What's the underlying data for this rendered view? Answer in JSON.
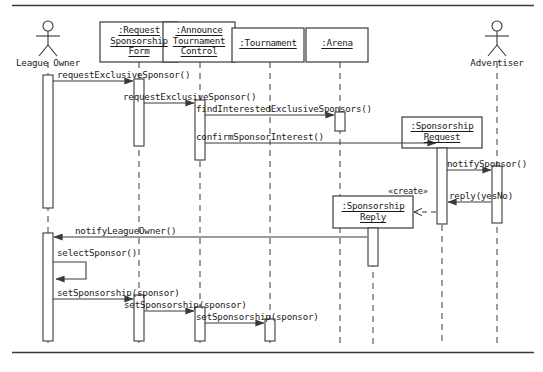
{
  "diagram": {
    "kind": "uml-sequence-diagram",
    "title": "",
    "frame": {
      "top_rule_y": 5,
      "bottom_rule_y": 352,
      "rule_color": "#3a3a3a"
    },
    "stroke_color": "#3a3a3a",
    "text_color": "#1a1a1a",
    "actors": [
      {
        "id": "league-owner",
        "label": "League Owner",
        "type": "actor",
        "x": 48
      },
      {
        "id": "advertiser",
        "label": "Advertiser",
        "type": "actor",
        "x": 497
      }
    ],
    "objects": [
      {
        "id": "request-sponsorship-form",
        "lines": [
          ":Request",
          "Sponsorship",
          "Form"
        ],
        "x": 139,
        "box": {
          "left": 100,
          "top": 22,
          "width": 78,
          "height": 40
        }
      },
      {
        "id": "announce-tournament-control",
        "lines": [
          ":Announce",
          "Tournament",
          "Control"
        ],
        "x": 200,
        "box": {
          "left": 163,
          "top": 22,
          "width": 72,
          "height": 40
        }
      },
      {
        "id": "tournament",
        "lines": [
          ":Tournament"
        ],
        "x": 270,
        "box": {
          "left": 232,
          "top": 28,
          "width": 72,
          "height": 34
        }
      },
      {
        "id": "arena",
        "lines": [
          ":Arena"
        ],
        "x": 340,
        "box": {
          "left": 306,
          "top": 28,
          "width": 62,
          "height": 34
        }
      },
      {
        "id": "sponsorship-request",
        "lines": [
          ":Sponsorship",
          "Request"
        ],
        "x": 442,
        "box": {
          "left": 402,
          "top": 117,
          "width": 80,
          "height": 31
        },
        "created": true
      },
      {
        "id": "sponsorship-reply",
        "lines": [
          ":Sponsorship",
          "Reply"
        ],
        "x": 373,
        "box": {
          "left": 333,
          "top": 196,
          "width": 80,
          "height": 32
        },
        "created": true
      }
    ],
    "messages": [
      {
        "id": "m1",
        "label": "requestExclusiveSponsor()",
        "from": "league-owner",
        "to": "request-sponsorship-form",
        "y": 81,
        "kind": "sync"
      },
      {
        "id": "m2",
        "label": "requestExclusiveSponsor()",
        "from": "request-sponsorship-form",
        "to": "announce-tournament-control",
        "y": 103,
        "kind": "sync"
      },
      {
        "id": "m3",
        "label": "findInterestedExclusiveSponsors()",
        "from": "announce-tournament-control",
        "to": "arena",
        "y": 115,
        "kind": "sync"
      },
      {
        "id": "m4",
        "label": "confirmSponsorInterest()",
        "from": "announce-tournament-control",
        "to": "sponsorship-request",
        "y": 143,
        "kind": "sync"
      },
      {
        "id": "m5",
        "label": "notifySponsor()",
        "from": "sponsorship-request",
        "to": "advertiser",
        "y": 170,
        "kind": "sync"
      },
      {
        "id": "m6",
        "label": "reply(yesNo)",
        "from": "advertiser",
        "to": "sponsorship-request",
        "y": 202,
        "kind": "sync"
      },
      {
        "id": "m7",
        "label": "«create»",
        "from": "sponsorship-request",
        "to": "sponsorship-reply",
        "y": 212,
        "kind": "create"
      },
      {
        "id": "m8",
        "label": "notifyLeagueOwner()",
        "from": "sponsorship-reply",
        "to": "league-owner",
        "y": 237,
        "kind": "sync"
      },
      {
        "id": "m9",
        "label": "selectSponsor()",
        "from": "league-owner",
        "to": "league-owner",
        "y": 256,
        "kind": "self"
      },
      {
        "id": "m10",
        "label": "setSponsorship(sponsor)",
        "from": "league-owner",
        "to": "request-sponsorship-form",
        "y": 299,
        "kind": "sync"
      },
      {
        "id": "m11",
        "label": "setSponsorship(sponsor)",
        "from": "request-sponsorship-form",
        "to": "announce-tournament-control",
        "y": 311,
        "kind": "sync"
      },
      {
        "id": "m12",
        "label": "setSponsorship(sponsor)",
        "from": "announce-tournament-control",
        "to": "tournament",
        "y": 323,
        "kind": "sync"
      }
    ],
    "activations": [
      {
        "id": "act-league-owner-1",
        "lifeline": "league-owner",
        "x": 48,
        "top": 75,
        "height": 133
      },
      {
        "id": "act-league-owner-2",
        "lifeline": "league-owner",
        "x": 48,
        "top": 233,
        "height": 108
      },
      {
        "id": "act-form-1",
        "lifeline": "request-sponsorship-form",
        "x": 139,
        "top": 79,
        "height": 67
      },
      {
        "id": "act-form-2",
        "lifeline": "request-sponsorship-form",
        "x": 139,
        "top": 295,
        "height": 46
      },
      {
        "id": "act-control-1",
        "lifeline": "announce-tournament-control",
        "x": 200,
        "top": 100,
        "height": 60
      },
      {
        "id": "act-control-2",
        "lifeline": "announce-tournament-control",
        "x": 200,
        "top": 307,
        "height": 34
      },
      {
        "id": "act-tournament-1",
        "lifeline": "tournament",
        "x": 270,
        "top": 319,
        "height": 22
      },
      {
        "id": "act-arena-1",
        "lifeline": "arena",
        "x": 340,
        "top": 112,
        "height": 19
      },
      {
        "id": "act-sponsorship-req",
        "lifeline": "sponsorship-request",
        "x": 442,
        "top": 148,
        "height": 76
      },
      {
        "id": "act-sponsorship-rep",
        "lifeline": "sponsorship-reply",
        "x": 373,
        "top": 228,
        "height": 38
      },
      {
        "id": "act-advertiser-1",
        "lifeline": "advertiser",
        "x": 497,
        "top": 166,
        "height": 57
      }
    ]
  }
}
